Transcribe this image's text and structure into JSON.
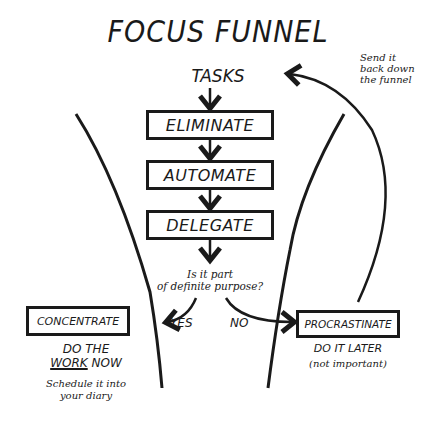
{
  "title": "FOCUS FUNNEL",
  "start": "TASKS",
  "steps": [
    {
      "label": "ELIMINATE"
    },
    {
      "label": "AUTOMATE"
    },
    {
      "label": "DELEGATE"
    }
  ],
  "decision": {
    "question_line1": "Is it part",
    "question_line2": "of definite purpose?",
    "yes_label": "YES",
    "no_label": "NO"
  },
  "outcomes": {
    "yes": {
      "label": "CONCENTRATE",
      "action_line1": "DO THE",
      "action_emphasis": "WORK",
      "action_line2_rest": " NOW",
      "note_line1": "Schedule it into",
      "note_line2": "your diary"
    },
    "no": {
      "label": "PROCRASTINATE",
      "action": "DO IT LATER",
      "note": "(not important)"
    }
  },
  "loop_note": {
    "line1": "Send it",
    "line2": "back down",
    "line3": "the funnel"
  },
  "colors": {
    "ink": "#1a1a1a",
    "background": "#ffffff"
  }
}
